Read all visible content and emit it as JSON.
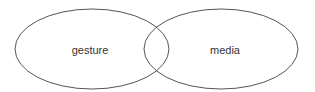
{
  "diagram": {
    "type": "venn",
    "sets": [
      {
        "label": "gesture",
        "cx": 92,
        "cy": 49,
        "rx": 77,
        "ry": 40
      },
      {
        "label": "media",
        "cx": 221,
        "cy": 49,
        "rx": 77,
        "ry": 40
      }
    ],
    "stroke_color": "#555555",
    "background": "#ffffff"
  }
}
